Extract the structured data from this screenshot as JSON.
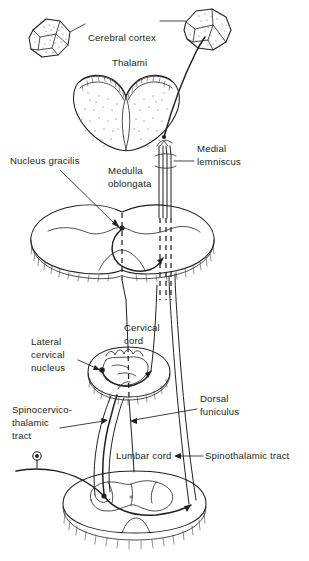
{
  "figure": {
    "background_color": "#ffffff",
    "ink_color": "#231f20"
  },
  "labels": [
    {
      "id": "cerebral-cortex",
      "text": "Cerebral cortex",
      "x": 88,
      "y": 41
    },
    {
      "id": "thalami",
      "text": "Thalami",
      "x": 112,
      "y": 66
    },
    {
      "id": "nucleus-gracilis",
      "text": "Nucleus gracilis",
      "x": 10,
      "y": 164
    },
    {
      "id": "medulla-1",
      "text": "Medulla",
      "x": 108,
      "y": 174
    },
    {
      "id": "medulla-2",
      "text": "oblongata",
      "x": 108,
      "y": 187
    },
    {
      "id": "medial-1",
      "text": "Medial",
      "x": 197,
      "y": 152
    },
    {
      "id": "medial-2",
      "text": "lemniscus",
      "x": 197,
      "y": 165
    },
    {
      "id": "cervical-1",
      "text": "Cervical",
      "x": 124,
      "y": 331
    },
    {
      "id": "cervical-2",
      "text": "cord",
      "x": 124,
      "y": 344
    },
    {
      "id": "lateral-1",
      "text": "Lateral",
      "x": 31,
      "y": 345
    },
    {
      "id": "lateral-2",
      "text": "cervical",
      "x": 31,
      "y": 358
    },
    {
      "id": "lateral-3",
      "text": "nucleus",
      "x": 31,
      "y": 371
    },
    {
      "id": "dorsal-1",
      "text": "Dorsal",
      "x": 200,
      "y": 402
    },
    {
      "id": "dorsal-2",
      "text": "funiculus",
      "x": 200,
      "y": 415
    },
    {
      "id": "spinocervico-1",
      "text": "Spinocervico-",
      "x": 12,
      "y": 413
    },
    {
      "id": "spinocervico-2",
      "text": "thalamic",
      "x": 12,
      "y": 426
    },
    {
      "id": "spinocervico-3",
      "text": "tract",
      "x": 12,
      "y": 439
    },
    {
      "id": "lumbar-cord",
      "text": "Lumbar cord",
      "x": 116,
      "y": 459
    },
    {
      "id": "spinothalamic",
      "text": "Spinothalamic tract",
      "x": 205,
      "y": 459
    }
  ],
  "structures": [
    {
      "id": "cortex-block-left",
      "name": "Cerebral cortex block (left)",
      "cx": 50,
      "cy": 38
    },
    {
      "id": "cortex-block-right",
      "name": "Cerebral cortex block (right)",
      "cx": 203,
      "cy": 30
    },
    {
      "id": "thalami-section",
      "name": "Thalami coronal section",
      "cx": 125,
      "cy": 105
    },
    {
      "id": "medulla-section",
      "name": "Medulla oblongata section",
      "cx": 122,
      "cy": 245
    },
    {
      "id": "cervical-section",
      "name": "Cervical cord section",
      "cx": 130,
      "cy": 375
    },
    {
      "id": "lumbar-section",
      "name": "Lumbar cord section",
      "cx": 135,
      "cy": 505
    },
    {
      "id": "medial-lemniscus-bundle",
      "name": "Medial lemniscus fiber bundle"
    },
    {
      "id": "dorsal-funiculus-tract",
      "name": "Dorsal funiculus ascending tract"
    },
    {
      "id": "spinocervicothalamic-tract",
      "name": "Spinocervicothalamic tract"
    },
    {
      "id": "spinothalamic-tract",
      "name": "Spinothalamic tract"
    },
    {
      "id": "peripheral-receptor",
      "name": "Peripheral sensory receptor",
      "cx": 37,
      "cy": 456
    },
    {
      "id": "lateral-cervical-nucleus-dot",
      "name": "Lateral cervical nucleus synapse",
      "cx": 102,
      "cy": 370
    },
    {
      "id": "nucleus-gracilis-dot",
      "name": "Nucleus gracilis synapse",
      "cx": 122,
      "cy": 228
    }
  ]
}
